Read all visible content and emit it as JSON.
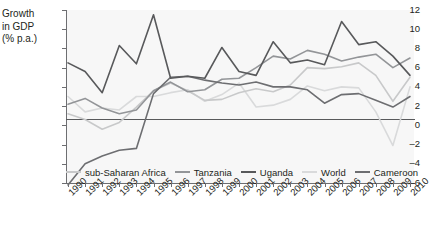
{
  "chart_data": {
    "type": "line",
    "title": "",
    "ylabel": "Growth in GDP (% p.a.)",
    "ylabel_lines": [
      "Growth",
      "in GDP",
      "(% p.a.)"
    ],
    "xlabel": "",
    "ylim": [
      -6,
      12
    ],
    "yticks": [
      12,
      10,
      8,
      6,
      4,
      2,
      0,
      -2,
      -4,
      -6
    ],
    "ytick_labels": [
      "12",
      "10",
      "8",
      "6",
      "4",
      "2",
      "0",
      "–2",
      "–4",
      "–6"
    ],
    "grid": false,
    "legend_position": "bottom",
    "x": [
      1990,
      1991,
      1992,
      1993,
      1994,
      1995,
      1996,
      1997,
      1998,
      1999,
      2000,
      2001,
      2002,
      2003,
      2004,
      2005,
      2006,
      2007,
      2008,
      2009,
      2010
    ],
    "categories": [
      "1990",
      "1991",
      "1992",
      "1993",
      "1994",
      "1995",
      "1996",
      "1997",
      "1998",
      "1999",
      "2000",
      "2001",
      "2002",
      "2003",
      "2004",
      "2005",
      "2006",
      "2007",
      "2008",
      "2009",
      "2010"
    ],
    "series": [
      {
        "name": "sub-Saharan Africa",
        "color": "#c8c9ca",
        "values": [
          1.2,
          0.6,
          -0.4,
          0.3,
          1.9,
          3.6,
          4.4,
          3.6,
          2.6,
          2.7,
          3.4,
          3.8,
          3.5,
          4.2,
          6.0,
          5.9,
          6.1,
          6.5,
          5.2,
          2.5,
          5.0
        ]
      },
      {
        "name": "Tanzania",
        "color": "#939598",
        "values": [
          2.2,
          2.8,
          1.8,
          1.2,
          1.6,
          3.6,
          4.5,
          3.5,
          3.7,
          4.8,
          4.9,
          6.0,
          7.2,
          6.9,
          7.8,
          7.4,
          6.7,
          7.1,
          7.4,
          6.0,
          7.0
        ]
      },
      {
        "name": "Uganda",
        "color": "#58595b",
        "values": [
          6.5,
          5.6,
          3.4,
          8.3,
          6.4,
          11.5,
          4.9,
          5.1,
          4.9,
          8.1,
          5.6,
          5.2,
          8.7,
          6.5,
          6.8,
          6.3,
          10.8,
          8.4,
          8.7,
          7.2,
          5.2
        ]
      },
      {
        "name": "World",
        "color": "#d9dadb",
        "values": [
          3.0,
          1.4,
          1.8,
          1.6,
          3.0,
          3.0,
          3.4,
          3.7,
          2.5,
          3.2,
          4.4,
          1.9,
          2.1,
          2.7,
          4.1,
          3.6,
          4.0,
          3.9,
          1.4,
          -2.1,
          4.0
        ]
      },
      {
        "name": "Cameroon",
        "color": "#6d6e71",
        "values": [
          -6.2,
          -4.0,
          -3.2,
          -2.6,
          -2.4,
          3.3,
          5.0,
          5.1,
          4.7,
          4.4,
          4.2,
          4.5,
          4.0,
          4.0,
          3.7,
          2.3,
          3.2,
          3.3,
          2.6,
          1.9,
          3.0
        ]
      }
    ]
  }
}
